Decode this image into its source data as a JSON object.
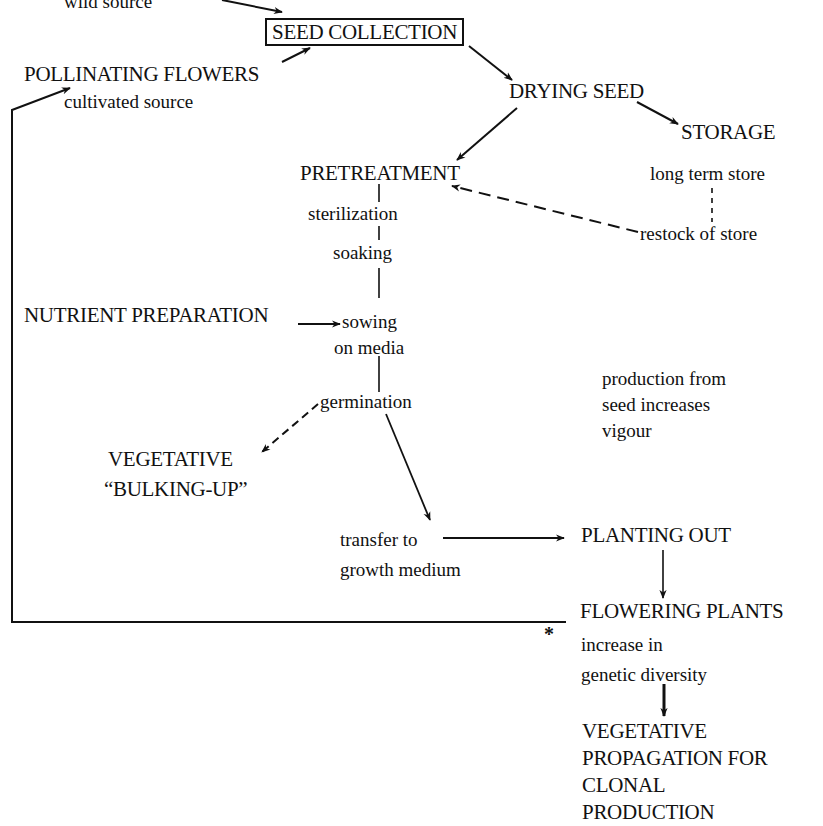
{
  "diagram": {
    "type": "flowchart",
    "nodes": {
      "wild_source": {
        "text": "wild source"
      },
      "seed_collection": {
        "text": "SEED COLLECTION"
      },
      "pollinating_flowers": {
        "text": "POLLINATING FLOWERS"
      },
      "cultivated_source": {
        "text": "cultivated source"
      },
      "drying_seed": {
        "text": "DRYING SEED"
      },
      "storage": {
        "text": "STORAGE"
      },
      "pretreatment": {
        "text": "PRETREATMENT"
      },
      "long_term_store": {
        "text": "long term store"
      },
      "sterilization": {
        "text": "sterilization"
      },
      "restock_of_store": {
        "text": "restock of store"
      },
      "soaking": {
        "text": "soaking"
      },
      "nutrient_preparation": {
        "text": "NUTRIENT PREPARATION"
      },
      "sowing": {
        "line1": "sowing",
        "line2": "on media"
      },
      "germination": {
        "text": "germination"
      },
      "production_note": {
        "line1": "production from",
        "line2": "seed increases",
        "line3": "vigour"
      },
      "vegetative_bulking": {
        "line1": "VEGETATIVE",
        "line2": "“BULKING-UP”"
      },
      "transfer": {
        "line1": "transfer to",
        "line2": "growth medium"
      },
      "planting_out": {
        "text": "PLANTING OUT"
      },
      "flowering_plants": {
        "text": "FLOWERING PLANTS"
      },
      "asterisk": {
        "text": "*"
      },
      "genetic_diversity": {
        "line1": "increase in",
        "line2": "genetic diversity"
      },
      "vegetative_propagation": {
        "line1": "VEGETATIVE",
        "line2": "PROPAGATION FOR",
        "line3": "CLONAL",
        "line4": "PRODUCTION"
      }
    },
    "edges": [
      {
        "from": "wild source",
        "to": "SEED COLLECTION",
        "style": "solid-arrow"
      },
      {
        "from": "POLLINATING FLOWERS",
        "to": "SEED COLLECTION",
        "style": "solid-arrow"
      },
      {
        "from": "SEED COLLECTION",
        "to": "DRYING SEED",
        "style": "solid-arrow"
      },
      {
        "from": "DRYING SEED",
        "to": "STORAGE",
        "style": "solid-arrow"
      },
      {
        "from": "DRYING SEED",
        "to": "PRETREATMENT",
        "style": "solid-arrow"
      },
      {
        "from": "long term store",
        "to": "restock of store",
        "style": "dashed-line"
      },
      {
        "from": "restock of store",
        "to": "PRETREATMENT",
        "style": "dashed-arrow"
      },
      {
        "from": "PRETREATMENT",
        "to": "sterilization",
        "style": "solid-line"
      },
      {
        "from": "sterilization",
        "to": "soaking",
        "style": "solid-line"
      },
      {
        "from": "soaking",
        "to": "sowing on media",
        "style": "solid-line"
      },
      {
        "from": "NUTRIENT PREPARATION",
        "to": "sowing on media",
        "style": "solid-arrow"
      },
      {
        "from": "sowing on media",
        "to": "germination",
        "style": "solid-line"
      },
      {
        "from": "germination",
        "to": "VEGETATIVE BULKING-UP",
        "style": "dashed-arrow"
      },
      {
        "from": "germination",
        "to": "transfer to growth medium",
        "style": "solid-arrow"
      },
      {
        "from": "transfer to growth medium",
        "to": "PLANTING OUT",
        "style": "solid-arrow"
      },
      {
        "from": "PLANTING OUT",
        "to": "FLOWERING PLANTS",
        "style": "solid-arrow"
      },
      {
        "from": "FLOWERING PLANTS",
        "to": "POLLINATING FLOWERS",
        "style": "solid-arrow",
        "route": "left loop"
      },
      {
        "from": "genetic diversity",
        "to": "VEGETATIVE PROPAGATION FOR CLONAL PRODUCTION",
        "style": "solid-arrow"
      }
    ],
    "colors": {
      "ink": "#111111",
      "background": "#ffffff"
    }
  }
}
